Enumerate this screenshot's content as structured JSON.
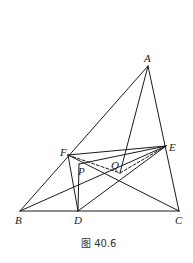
{
  "figure": {
    "caption": "图 40.6",
    "points": {
      "A": {
        "label": "A",
        "x": 148,
        "y": 66
      },
      "B": {
        "label": "B",
        "x": 20,
        "y": 211
      },
      "C": {
        "label": "C",
        "x": 179,
        "y": 211
      },
      "D": {
        "label": "D",
        "x": 78,
        "y": 211
      },
      "E": {
        "label": "E",
        "x": 166,
        "y": 146
      },
      "F": {
        "label": "F",
        "x": 68,
        "y": 155
      },
      "P": {
        "label": "P",
        "x": 79,
        "y": 164
      },
      "Q": {
        "label": "Q",
        "x": 120,
        "y": 173
      }
    },
    "segments": [
      {
        "from": "A",
        "to": "B",
        "style": "solid"
      },
      {
        "from": "B",
        "to": "C",
        "style": "solid"
      },
      {
        "from": "C",
        "to": "A",
        "style": "solid"
      },
      {
        "from": "A",
        "to": "Q",
        "style": "solid"
      },
      {
        "from": "F",
        "to": "E",
        "style": "solid"
      },
      {
        "from": "P",
        "to": "E",
        "style": "solid"
      },
      {
        "from": "F",
        "to": "D",
        "style": "solid"
      },
      {
        "from": "P",
        "to": "D",
        "style": "solid"
      },
      {
        "from": "B",
        "to": "E",
        "style": "solid"
      },
      {
        "from": "D",
        "to": "E",
        "style": "solid"
      },
      {
        "from": "F",
        "to": "C",
        "style": "solid"
      },
      {
        "from": "F",
        "to": "Q",
        "style": "dashed"
      },
      {
        "from": "Q",
        "to": "E",
        "style": "dashed"
      }
    ]
  }
}
